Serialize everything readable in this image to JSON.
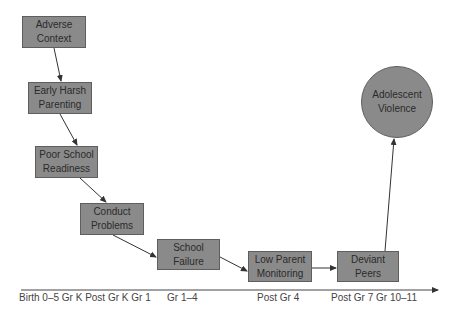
{
  "diagram": {
    "nodes": [
      {
        "id": "adverse-context",
        "line1": "Adverse",
        "line2": "Context"
      },
      {
        "id": "early-harsh-parenting",
        "line1": "Early Harsh",
        "line2": "Parenting"
      },
      {
        "id": "poor-school-readiness",
        "line1": "Poor School",
        "line2": "Readiness"
      },
      {
        "id": "conduct-problems",
        "line1": "Conduct",
        "line2": "Problems"
      },
      {
        "id": "school-failure",
        "line1": "School",
        "line2": "Failure"
      },
      {
        "id": "low-parent-monitoring",
        "line1": "Low Parent",
        "line2": "Monitoring"
      },
      {
        "id": "deviant-peers",
        "line1": "Deviant",
        "line2": "Peers"
      },
      {
        "id": "adolescent-violence",
        "line1": "Adolescent",
        "line2": "Violence"
      }
    ],
    "edges": [
      [
        "adverse-context",
        "early-harsh-parenting"
      ],
      [
        "early-harsh-parenting",
        "poor-school-readiness"
      ],
      [
        "poor-school-readiness",
        "conduct-problems"
      ],
      [
        "conduct-problems",
        "school-failure"
      ],
      [
        "school-failure",
        "low-parent-monitoring"
      ],
      [
        "low-parent-monitoring",
        "deviant-peers"
      ],
      [
        "deviant-peers",
        "adolescent-violence"
      ]
    ],
    "timeline": {
      "labels": [
        "Birth 0–5 Gr K Post Gr K Gr 1",
        "Gr 1–4",
        "Post Gr 4",
        "Post Gr 7 Gr 10–11"
      ]
    },
    "colors": {
      "node_fill": "#8a8a8a",
      "node_border": "#5e5e5e",
      "text": "#2a2a2a",
      "arrow": "#333333"
    }
  }
}
